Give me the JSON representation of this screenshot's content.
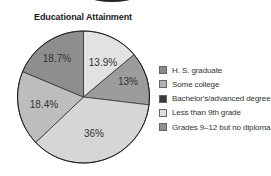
{
  "chart_data": {
    "type": "pie",
    "title": "Educational Attainment",
    "start_angle_deg": 0,
    "direction": "clockwise",
    "slices": [
      {
        "label": "Less than 9th grade",
        "value": 13.9,
        "display": "13.9%",
        "color": "#e2e2e2"
      },
      {
        "label": "Grades 9–12 but no diploma",
        "value": 13.0,
        "display": "13%",
        "color": "#9c9c9c"
      },
      {
        "label": "H. S. graduate",
        "value": 36.0,
        "display": "36%",
        "color": "#d6d6d6"
      },
      {
        "label": "Some college",
        "value": 18.4,
        "display": "18.4%",
        "color": "#bdbdbd"
      },
      {
        "label": "Bachelor's/advanced degree",
        "value": 18.7,
        "display": "18.7%",
        "color": "#8e8e8e"
      }
    ],
    "legend_position": "right",
    "legend": [
      {
        "label": "H. S. graduate",
        "color": "#8c8c8c"
      },
      {
        "label": "Some college",
        "color": "#b3b3b3"
      },
      {
        "label": "Bachelor's/advanced degree",
        "color": "#3a3a3a"
      },
      {
        "label": "Less than 9th grade",
        "color": "#dedede"
      },
      {
        "label": "Grades 9–12 but no diploma",
        "color": "#939393"
      }
    ]
  },
  "title": "Educational Attainment",
  "pie_labels": [
    "13.9%",
    "13%",
    "36%",
    "18.4%",
    "18.7%"
  ],
  "legend_labels": [
    "H. S. graduate",
    "Some college",
    "Bachelor's/advanced degree",
    "Less than 9th grade",
    "Grades 9–12 but no diploma"
  ]
}
